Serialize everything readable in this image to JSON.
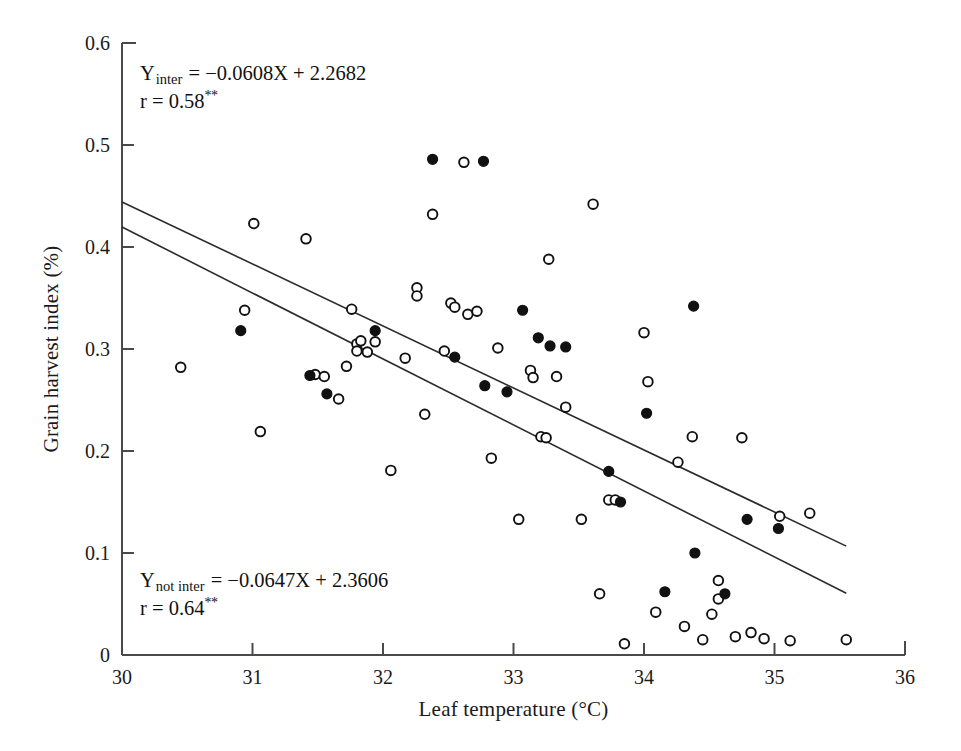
{
  "chart_data": {
    "type": "scatter",
    "title": "",
    "xlabel": "Leaf temperature  (°C)",
    "ylabel": "Grain harvest index (%)",
    "xlim": [
      30,
      36
    ],
    "ylim": [
      0,
      0.6
    ],
    "xticks": [
      30,
      31,
      32,
      33,
      34,
      35,
      36
    ],
    "xtick_labels": [
      "30",
      "31",
      "32",
      "33",
      "34",
      "35",
      "36"
    ],
    "yticks": [
      0,
      0.1,
      0.2,
      0.3,
      0.4,
      0.5,
      0.6
    ],
    "ytick_labels": [
      "0",
      "0.1",
      "0.2",
      "0.3",
      "0.4",
      "0.5",
      "0.6"
    ],
    "grid": false,
    "legend": "none",
    "series": [
      {
        "name": "open",
        "marker": "open-circle",
        "color": "#111111",
        "fill": "none",
        "points": [
          [
            30.45,
            0.282
          ],
          [
            30.94,
            0.338
          ],
          [
            31.01,
            0.423
          ],
          [
            31.06,
            0.219
          ],
          [
            31.41,
            0.408
          ],
          [
            31.48,
            0.275
          ],
          [
            31.55,
            0.273
          ],
          [
            31.66,
            0.251
          ],
          [
            31.72,
            0.283
          ],
          [
            31.76,
            0.339
          ],
          [
            31.8,
            0.305
          ],
          [
            31.8,
            0.298
          ],
          [
            31.83,
            0.308
          ],
          [
            31.88,
            0.297
          ],
          [
            31.94,
            0.307
          ],
          [
            32.06,
            0.181
          ],
          [
            32.17,
            0.291
          ],
          [
            32.26,
            0.36
          ],
          [
            32.26,
            0.352
          ],
          [
            32.32,
            0.236
          ],
          [
            32.38,
            0.432
          ],
          [
            32.47,
            0.298
          ],
          [
            32.52,
            0.345
          ],
          [
            32.55,
            0.341
          ],
          [
            32.62,
            0.483
          ],
          [
            32.65,
            0.334
          ],
          [
            32.72,
            0.337
          ],
          [
            32.83,
            0.193
          ],
          [
            32.88,
            0.301
          ],
          [
            33.04,
            0.133
          ],
          [
            33.13,
            0.279
          ],
          [
            33.15,
            0.272
          ],
          [
            33.21,
            0.214
          ],
          [
            33.25,
            0.213
          ],
          [
            33.27,
            0.388
          ],
          [
            33.33,
            0.273
          ],
          [
            33.4,
            0.243
          ],
          [
            33.52,
            0.133
          ],
          [
            33.61,
            0.442
          ],
          [
            33.66,
            0.06
          ],
          [
            33.73,
            0.152
          ],
          [
            33.78,
            0.152
          ],
          [
            33.85,
            0.011
          ],
          [
            34.0,
            0.316
          ],
          [
            34.03,
            0.268
          ],
          [
            34.09,
            0.042
          ],
          [
            34.26,
            0.189
          ],
          [
            34.31,
            0.028
          ],
          [
            34.37,
            0.214
          ],
          [
            34.45,
            0.015
          ],
          [
            34.52,
            0.04
          ],
          [
            34.57,
            0.073
          ],
          [
            34.57,
            0.055
          ],
          [
            34.7,
            0.018
          ],
          [
            34.75,
            0.213
          ],
          [
            34.82,
            0.022
          ],
          [
            34.92,
            0.016
          ],
          [
            35.04,
            0.136
          ],
          [
            35.12,
            0.014
          ],
          [
            35.27,
            0.139
          ],
          [
            35.55,
            0.015
          ]
        ]
      },
      {
        "name": "filled",
        "marker": "filled-circle",
        "color": "#111111",
        "fill": "#111111",
        "points": [
          [
            30.91,
            0.318
          ],
          [
            31.44,
            0.274
          ],
          [
            31.57,
            0.256
          ],
          [
            31.94,
            0.318
          ],
          [
            32.38,
            0.486
          ],
          [
            32.55,
            0.292
          ],
          [
            32.77,
            0.484
          ],
          [
            32.78,
            0.264
          ],
          [
            32.95,
            0.258
          ],
          [
            33.07,
            0.338
          ],
          [
            33.19,
            0.311
          ],
          [
            33.28,
            0.303
          ],
          [
            33.4,
            0.302
          ],
          [
            33.73,
            0.18
          ],
          [
            33.82,
            0.15
          ],
          [
            34.02,
            0.237
          ],
          [
            34.16,
            0.062
          ],
          [
            34.38,
            0.342
          ],
          [
            34.39,
            0.1
          ],
          [
            34.62,
            0.06
          ],
          [
            34.79,
            0.133
          ],
          [
            35.03,
            0.124
          ]
        ]
      }
    ],
    "fit_lines": [
      {
        "name": "inter",
        "slope": -0.0608,
        "intercept": 2.2682,
        "x_start": 30.0,
        "x_end": 35.55,
        "equation_y": "Y",
        "equation_sub": "inter",
        "equation_rest": "= −0.0608X + 2.2682",
        "r_text": "r = 0.58",
        "r_sig": "**"
      },
      {
        "name": "not inter",
        "slope": -0.0647,
        "intercept": 2.3606,
        "x_start": 30.0,
        "x_end": 35.55,
        "equation_y": "Y",
        "equation_sub": "not inter",
        "equation_rest": "= −0.0647X + 2.3606",
        "r_text": "r = 0.64",
        "r_sig": "**"
      }
    ]
  },
  "annotations": {
    "top": {
      "y_symbol": "Y",
      "subscript": "inter",
      "equation": "= −0.0608X + 2.2682",
      "r_line": "r = 0.58",
      "significance": "**"
    },
    "bottom": {
      "y_symbol": "Y",
      "subscript": "not inter",
      "equation": "= −0.0647X + 2.3606",
      "r_line": "r = 0.64",
      "significance": "**"
    }
  },
  "axes": {
    "x_title": "Leaf temperature  (°C)",
    "y_title": "Grain harvest index (%)"
  },
  "colors": {
    "axis": "#4a4a4a",
    "marker": "#111111",
    "line": "#2b2b2b",
    "background": "#ffffff"
  }
}
